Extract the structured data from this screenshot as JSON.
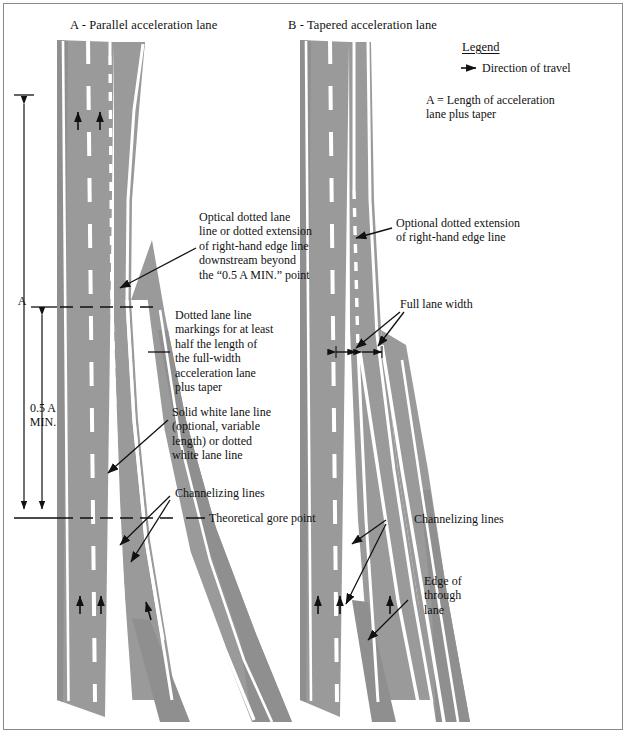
{
  "figure": {
    "panels": [
      {
        "id": "A",
        "title": "A - Parallel acceleration lane"
      },
      {
        "id": "B",
        "title": "B - Tapered acceleration lane"
      }
    ],
    "legend": {
      "title": "Legend",
      "arrow_icon": "right-arrow-icon",
      "arrow_label": "Direction of travel",
      "definition": "A = Length of acceleration\n      lane plus taper"
    },
    "dimensions": [
      {
        "name": "A",
        "label": "A"
      },
      {
        "name": "half-a-min",
        "label": "0.5 A\nMIN."
      }
    ],
    "annotations_left": [
      {
        "name": "optical-dotted-lane-line",
        "text": "Optical dotted lane\nline or dotted extension\nof right-hand edge line\ndownstream beyond\nthe “0.5 A MIN.” point"
      },
      {
        "name": "dotted-lane-line-markings",
        "text": "Dotted lane line\nmarkings for at least\nhalf the length of\nthe full-width\nacceleration lane\nplus taper"
      },
      {
        "name": "solid-white-lane-line",
        "text": "Solid white lane line\n(optional, variable\nlength) or dotted\nwhite lane line"
      },
      {
        "name": "channelizing-lines-a",
        "text": "Channelizing lines"
      },
      {
        "name": "theoretical-gore-point",
        "text": "Theoretical gore point"
      }
    ],
    "annotations_right": [
      {
        "name": "optional-dotted-extension",
        "text": "Optional dotted extension\nof right-hand edge line"
      },
      {
        "name": "full-lane-width",
        "text": "Full lane width"
      },
      {
        "name": "channelizing-lines-b",
        "text": "Channelizing lines"
      },
      {
        "name": "edge-of-through-lane",
        "text": "Edge of\nthrough\nlane"
      }
    ],
    "colors": {
      "pavement": "#9a9a9a",
      "pavement_shadow": "#8a8a8a",
      "marking": "#ffffff",
      "ink": "#111111",
      "frame": "#8a8a8a"
    }
  }
}
